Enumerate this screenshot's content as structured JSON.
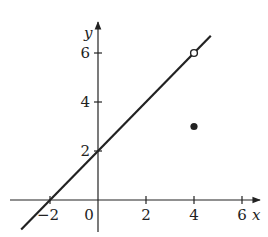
{
  "chart_data": {
    "type": "line",
    "title": "",
    "xlabel": "x",
    "ylabel": "y",
    "xlim": [
      -3.7,
      6.8
    ],
    "ylim": [
      -1.4,
      7.0
    ],
    "grid": false,
    "x_ticks": [
      -2,
      2,
      4,
      6
    ],
    "x_tick_labels": [
      "−2",
      "2",
      "4",
      "6"
    ],
    "y_ticks": [
      2,
      4,
      6
    ],
    "y_tick_labels": [
      "2",
      "4",
      "6"
    ],
    "origin_label": "0",
    "series": [
      {
        "name": "y = x + 2",
        "kind": "line",
        "x": [
          -3.2,
          4.7
        ],
        "y": [
          -1.2,
          6.7
        ],
        "color": "#222222"
      }
    ],
    "points": [
      {
        "name": "hole",
        "x": 4,
        "y": 6,
        "style": "open-circle"
      },
      {
        "name": "defined-value",
        "x": 4,
        "y": 3,
        "style": "filled-circle"
      }
    ],
    "annotations": []
  },
  "colors": {
    "ink": "#222222",
    "background": "#ffffff"
  }
}
